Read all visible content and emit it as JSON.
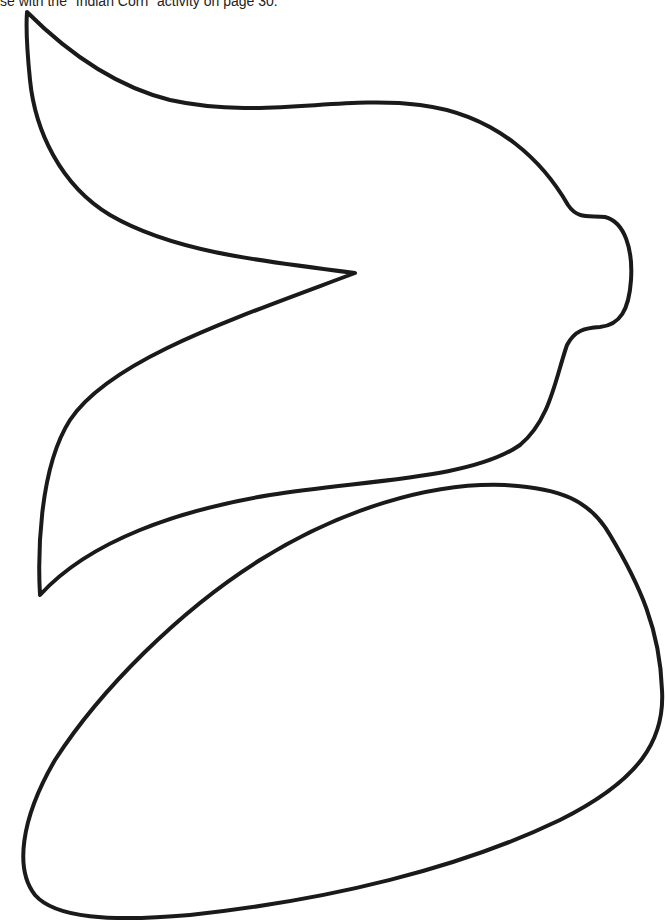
{
  "page": {
    "caption": "se with the \"Indian Corn\" activity on page 30."
  },
  "shapes": [
    {
      "name": "corn-husk",
      "label": "Husk template"
    },
    {
      "name": "corn-cob",
      "label": "Cob template"
    }
  ],
  "colors": {
    "stroke": "#1a1a1a",
    "background": "#ffffff"
  }
}
